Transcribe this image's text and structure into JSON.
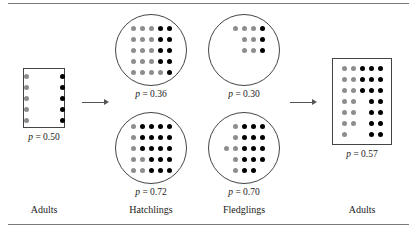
{
  "figure": {
    "colors": {
      "black_allele": "#000000",
      "gray_allele": "#8d8d8d",
      "outline": "#444444",
      "arrow": "#555555",
      "rule": "#7a7a7a",
      "background": "#ffffff"
    },
    "rules": {
      "top": true,
      "bottom": true
    }
  },
  "panels": [
    {
      "id": "adults-initial",
      "shape": "box",
      "caption": "Adults",
      "p_label": "p = 0.50",
      "p_value": 0.5,
      "columns": 5,
      "rows": 5,
      "counts": {
        "black": 5,
        "gray": 5,
        "total": 10
      },
      "grid": [
        [
          "gray",
          "empty",
          "empty",
          "empty",
          "black"
        ],
        [
          "gray",
          "empty",
          "empty",
          "empty",
          "black"
        ],
        [
          "gray",
          "empty",
          "empty",
          "empty",
          "black"
        ],
        [
          "gray",
          "empty",
          "empty",
          "empty",
          "black"
        ],
        [
          "gray",
          "empty",
          "empty",
          "empty",
          "black"
        ]
      ]
    },
    {
      "id": "hatchlings-top",
      "shape": "circle",
      "caption": "Hatchlings",
      "p_label": "p = 0.36",
      "p_value": 0.36,
      "columns": 5,
      "rows": 5,
      "counts": {
        "black": 9,
        "gray": 16,
        "total": 25
      },
      "grid": [
        [
          "gray",
          "gray",
          "gray",
          "black",
          "black"
        ],
        [
          "gray",
          "gray",
          "gray",
          "black",
          "black"
        ],
        [
          "gray",
          "gray",
          "gray",
          "black",
          "black"
        ],
        [
          "gray",
          "gray",
          "gray",
          "black",
          "black"
        ],
        [
          "gray",
          "gray",
          "gray",
          "gray",
          "black"
        ]
      ]
    },
    {
      "id": "fledglings-top",
      "shape": "circle",
      "caption": "Fledglings",
      "p_label": "p = 0.30",
      "p_value": 0.3,
      "columns": 5,
      "rows": 5,
      "counts": {
        "black": 3,
        "gray": 7,
        "total": 10
      },
      "grid": [
        [
          "empty",
          "gray",
          "gray",
          "gray",
          "black"
        ],
        [
          "empty",
          "empty",
          "gray",
          "gray",
          "black"
        ],
        [
          "empty",
          "empty",
          "gray",
          "gray",
          "black"
        ],
        [
          "empty",
          "empty",
          "empty",
          "empty",
          "empty"
        ],
        [
          "empty",
          "empty",
          "empty",
          "empty",
          "empty"
        ]
      ]
    },
    {
      "id": "hatchlings-bottom",
      "shape": "circle",
      "caption": "Hatchlings",
      "p_label": "p = 0.72",
      "p_value": 0.72,
      "columns": 5,
      "rows": 5,
      "counts": {
        "black": 18,
        "gray": 7,
        "total": 25
      },
      "grid": [
        [
          "gray",
          "black",
          "black",
          "black",
          "black"
        ],
        [
          "gray",
          "black",
          "black",
          "black",
          "black"
        ],
        [
          "gray",
          "black",
          "black",
          "black",
          "black"
        ],
        [
          "gray",
          "gray",
          "black",
          "black",
          "black"
        ],
        [
          "gray",
          "gray",
          "black",
          "black",
          "black"
        ]
      ]
    },
    {
      "id": "fledglings-bottom",
      "shape": "circle",
      "caption": "Fledglings",
      "p_label": "p = 0.70",
      "p_value": 0.7,
      "columns": 5,
      "rows": 5,
      "counts": {
        "black": 14,
        "gray": 6,
        "total": 20
      },
      "grid": [
        [
          "empty",
          "gray",
          "black",
          "black",
          "black"
        ],
        [
          "empty",
          "gray",
          "black",
          "black",
          "black"
        ],
        [
          "gray",
          "gray",
          "black",
          "black",
          "black"
        ],
        [
          "empty",
          "gray",
          "black",
          "black",
          "black"
        ],
        [
          "empty",
          "gray",
          "black",
          "black",
          "empty"
        ]
      ]
    },
    {
      "id": "adults-final",
      "shape": "box",
      "caption": "Adults",
      "p_label": "p = 0.57",
      "p_value": 0.57,
      "columns": 5,
      "rows": 7,
      "counts": {
        "black": 17,
        "gray": 13,
        "total": 30
      },
      "grid": [
        [
          "gray",
          "gray",
          "black",
          "black",
          "black"
        ],
        [
          "gray",
          "gray",
          "black",
          "black",
          "black"
        ],
        [
          "gray",
          "gray",
          "black",
          "black",
          "black"
        ],
        [
          "gray",
          "gray",
          "empty",
          "black",
          "black"
        ],
        [
          "gray",
          "gray",
          "empty",
          "black",
          "black"
        ],
        [
          "gray",
          "gray",
          "empty",
          "black",
          "black"
        ],
        [
          "gray",
          "empty",
          "empty",
          "black",
          "black"
        ]
      ]
    }
  ],
  "arrows": [
    {
      "id": "arrow-adults-to-hatchlings",
      "direction": "right"
    },
    {
      "id": "arrow-fledglings-to-adults",
      "direction": "right"
    }
  ]
}
